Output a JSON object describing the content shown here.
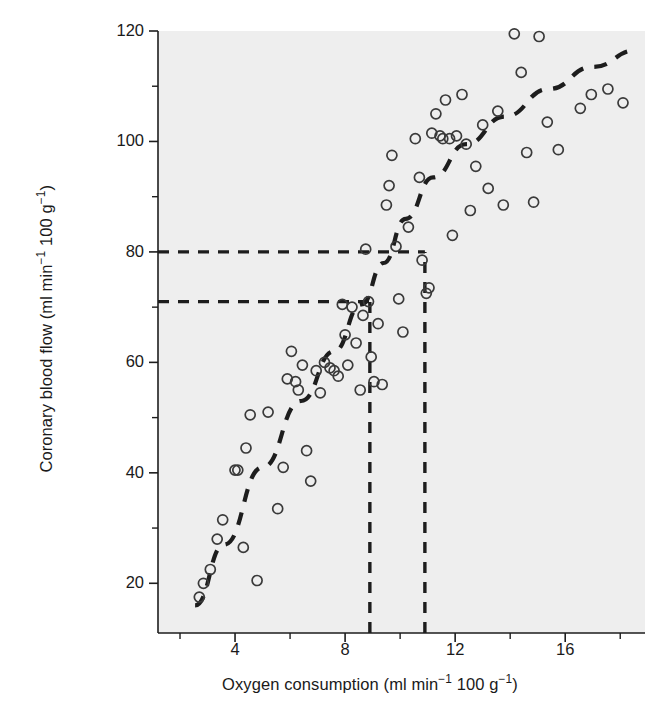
{
  "figure": {
    "background": "#ffffff",
    "plot_background": "#eeeeee",
    "ink": "#1d1d1d",
    "marker_edge": "#3a3a3a"
  },
  "annotation": {
    "line1": "Normal values at",
    "line2": "resting cardiac output"
  },
  "axes": {
    "y_tick_labels": [
      "120",
      "100",
      "80",
      "60",
      "40",
      "20"
    ],
    "x_tick_labels": [
      "4",
      "8",
      "12",
      "16"
    ]
  },
  "chart_data": {
    "type": "scatter",
    "title": "",
    "xlabel": "Oxygen consumption (ml min⁻¹ 100 g⁻¹)",
    "ylabel": "Coronary blood flow (ml min⁻¹ 100 g⁻¹)",
    "xlabel_parts": {
      "pre": "Oxygen consumption (ml min",
      "sup1": "−1",
      "mid": " 100 g",
      "sup2": "−1",
      "post": ")"
    },
    "ylabel_parts": {
      "pre": "Coronary blood flow (ml min",
      "sup1": "−1",
      "mid": " 100 g",
      "sup2": "−1",
      "post": ")"
    },
    "xlim": [
      1.2,
      18.9
    ],
    "ylim": [
      11.0,
      120.0
    ],
    "xticks": [
      4,
      8,
      12,
      16
    ],
    "xticks_minor": [
      2,
      6,
      10,
      14,
      18
    ],
    "yticks": [
      20,
      40,
      60,
      80,
      100,
      120
    ],
    "yticks_minor": [
      30,
      50,
      70,
      90,
      110
    ],
    "grid": false,
    "legend": null,
    "marker": "open-circle",
    "points": [
      [
        2.7,
        17.5
      ],
      [
        2.85,
        20.0
      ],
      [
        3.1,
        22.5
      ],
      [
        3.35,
        28.0
      ],
      [
        3.55,
        31.5
      ],
      [
        4.0,
        40.5
      ],
      [
        4.1,
        40.5
      ],
      [
        4.3,
        26.5
      ],
      [
        4.4,
        44.5
      ],
      [
        4.55,
        50.5
      ],
      [
        4.8,
        20.5
      ],
      [
        5.2,
        51.0
      ],
      [
        5.55,
        33.5
      ],
      [
        5.75,
        41.0
      ],
      [
        5.9,
        57.0
      ],
      [
        6.05,
        62.0
      ],
      [
        6.2,
        56.5
      ],
      [
        6.3,
        55.0
      ],
      [
        6.45,
        59.5
      ],
      [
        6.6,
        44.0
      ],
      [
        6.75,
        38.5
      ],
      [
        6.95,
        58.5
      ],
      [
        7.1,
        54.5
      ],
      [
        7.25,
        60.0
      ],
      [
        7.45,
        59.0
      ],
      [
        7.6,
        58.5
      ],
      [
        7.75,
        57.5
      ],
      [
        7.9,
        70.5
      ],
      [
        8.0,
        65.0
      ],
      [
        8.1,
        59.5
      ],
      [
        8.25,
        70.0
      ],
      [
        8.4,
        63.5
      ],
      [
        8.55,
        55.0
      ],
      [
        8.65,
        68.5
      ],
      [
        8.75,
        80.5
      ],
      [
        8.85,
        71.0
      ],
      [
        8.95,
        61.0
      ],
      [
        9.05,
        56.5
      ],
      [
        9.2,
        67.0
      ],
      [
        9.35,
        56.0
      ],
      [
        9.5,
        88.5
      ],
      [
        9.6,
        92.0
      ],
      [
        9.7,
        97.5
      ],
      [
        9.85,
        81.0
      ],
      [
        9.95,
        71.5
      ],
      [
        10.1,
        65.5
      ],
      [
        10.3,
        84.5
      ],
      [
        10.55,
        100.5
      ],
      [
        10.7,
        93.5
      ],
      [
        10.8,
        78.5
      ],
      [
        10.95,
        72.5
      ],
      [
        11.05,
        73.5
      ],
      [
        11.15,
        101.5
      ],
      [
        11.3,
        105.0
      ],
      [
        11.45,
        101.0
      ],
      [
        11.55,
        100.5
      ],
      [
        11.65,
        107.5
      ],
      [
        11.8,
        100.5
      ],
      [
        11.9,
        83.0
      ],
      [
        12.05,
        101.0
      ],
      [
        12.25,
        108.5
      ],
      [
        12.4,
        99.5
      ],
      [
        12.55,
        87.5
      ],
      [
        12.75,
        95.5
      ],
      [
        13.0,
        103.0
      ],
      [
        13.2,
        91.5
      ],
      [
        13.55,
        105.5
      ],
      [
        13.75,
        88.5
      ],
      [
        14.15,
        119.5
      ],
      [
        14.4,
        112.5
      ],
      [
        14.6,
        98.0
      ],
      [
        14.85,
        89.0
      ],
      [
        15.05,
        119.0
      ],
      [
        15.35,
        103.5
      ],
      [
        15.75,
        98.5
      ],
      [
        16.55,
        106.0
      ],
      [
        16.95,
        108.5
      ],
      [
        17.55,
        109.5
      ],
      [
        18.1,
        107.0
      ]
    ],
    "trend_line": {
      "style": "dashed",
      "x": [
        2.55,
        3.6,
        5.0,
        6.4,
        7.6,
        8.6,
        9.4,
        10.2,
        11.2,
        12.4,
        13.8,
        15.4,
        17.0,
        18.6
      ],
      "y": [
        16.0,
        27.0,
        41.0,
        53.0,
        62.0,
        70.5,
        78.0,
        86.0,
        93.5,
        99.5,
        104.5,
        109.5,
        113.5,
        116.5
      ]
    },
    "reference_lines": {
      "horizontal": [
        {
          "y": 80.0,
          "x_from": 1.2,
          "x_to": 10.9,
          "style": "dashed"
        },
        {
          "y": 71.0,
          "x_from": 1.2,
          "x_to": 8.9,
          "style": "dashed"
        }
      ],
      "vertical": [
        {
          "x": 8.9,
          "y_from": 11.0,
          "y_to": 71.0,
          "style": "dashed"
        },
        {
          "x": 10.9,
          "y_from": 11.0,
          "y_to": 80.0,
          "style": "dashed"
        }
      ]
    }
  }
}
